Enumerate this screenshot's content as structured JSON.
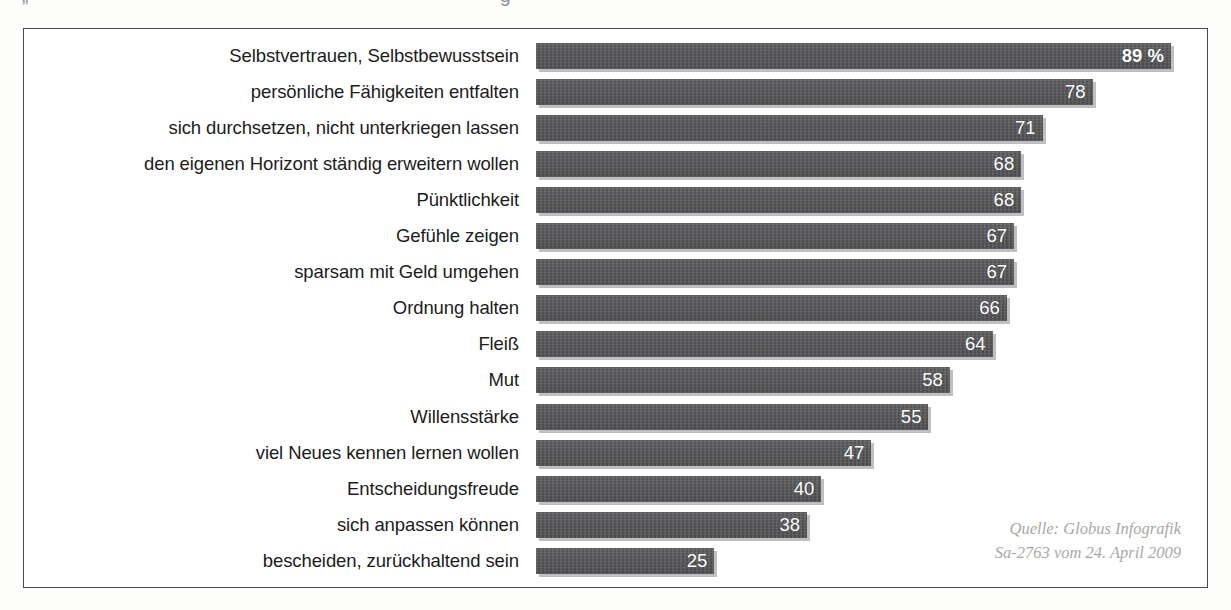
{
  "clipped_title_fragments": [
    "„",
    "g"
  ],
  "source_note": {
    "line1": "Quelle: Globus Infografik",
    "line2": "Sa-2763 vom 24. April 2009"
  },
  "colors": {
    "bar": "#59595b",
    "bar_shadow": "#aaaaac",
    "frame": "#4a4a4a",
    "value_text": "#ffffff",
    "label_text": "#1c1c1c",
    "source_text": "#a9a8a6",
    "background": "#ffffff"
  },
  "chart_data": {
    "type": "bar",
    "orientation": "horizontal",
    "title": "",
    "xlabel": "",
    "ylabel": "",
    "unit": "%",
    "xlim": [
      0,
      89
    ],
    "grid": false,
    "legend": null,
    "value_label_position": "inside-end",
    "categories": [
      "Selbstvertrauen, Selbstbewusstsein",
      "persönliche Fähigkeiten entfalten",
      "sich durchsetzen, nicht unterkriegen lassen",
      "den eigenen Horizont ständig erweitern wollen",
      "Pünktlichkeit",
      "Gefühle zeigen",
      "sparsam mit Geld umgehen",
      "Ordnung halten",
      "Fleiß",
      "Mut",
      "Willensstärke",
      "viel Neues kennen lernen wollen",
      "Entscheidungsfreude",
      "sich anpassen können",
      "bescheiden, zurückhaltend sein"
    ],
    "values": [
      89,
      78,
      71,
      68,
      68,
      67,
      67,
      66,
      64,
      58,
      55,
      47,
      40,
      38,
      25
    ],
    "value_labels": [
      "89 %",
      "78",
      "71",
      "68",
      "68",
      "67",
      "67",
      "66",
      "64",
      "58",
      "55",
      "47",
      "40",
      "38",
      "25"
    ]
  }
}
